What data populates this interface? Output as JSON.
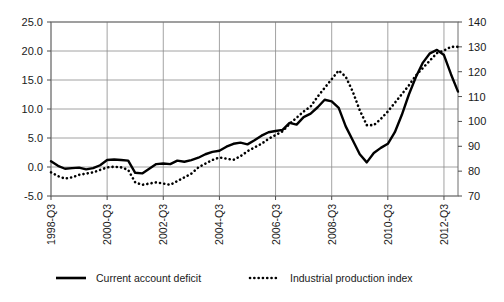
{
  "chart_data": {
    "type": "line",
    "title": "",
    "xlabel": "",
    "ylabel": "",
    "grid": true,
    "legend_position": "bottom",
    "x_tick_labels": [
      "1998-Q3",
      "2000-Q3",
      "2002-Q3",
      "2004-Q3",
      "2006-Q3",
      "2008-Q3",
      "2010-Q3",
      "2012-Q3"
    ],
    "x_tick_rotation": 90,
    "left_axis": {
      "label": "",
      "ylim": [
        -5.0,
        25.0
      ],
      "ticks": [
        "25.0",
        "20.0",
        "15.0",
        "10.0",
        "5.0",
        "0.0",
        "-5.0"
      ],
      "tick_values": [
        25.0,
        20.0,
        15.0,
        10.0,
        5.0,
        0.0,
        -5.0
      ]
    },
    "right_axis": {
      "label": "",
      "ylim": [
        70,
        140
      ],
      "ticks": [
        "140",
        "130",
        "120",
        "110",
        "100",
        "90",
        "80",
        "70"
      ],
      "tick_values": [
        140,
        130,
        120,
        110,
        100,
        90,
        80,
        70
      ]
    },
    "x": [
      "1998-Q3",
      "1998-Q4",
      "1999-Q1",
      "1999-Q2",
      "1999-Q3",
      "1999-Q4",
      "2000-Q1",
      "2000-Q2",
      "2000-Q3",
      "2000-Q4",
      "2001-Q1",
      "2001-Q2",
      "2001-Q3",
      "2001-Q4",
      "2002-Q1",
      "2002-Q2",
      "2002-Q3",
      "2002-Q4",
      "2003-Q1",
      "2003-Q2",
      "2003-Q3",
      "2003-Q4",
      "2004-Q1",
      "2004-Q2",
      "2004-Q3",
      "2004-Q4",
      "2005-Q1",
      "2005-Q2",
      "2005-Q3",
      "2005-Q4",
      "2006-Q1",
      "2006-Q2",
      "2006-Q3",
      "2006-Q4",
      "2007-Q1",
      "2007-Q2",
      "2007-Q3",
      "2007-Q4",
      "2008-Q1",
      "2008-Q2",
      "2008-Q3",
      "2008-Q4",
      "2009-Q1",
      "2009-Q2",
      "2009-Q3",
      "2009-Q4",
      "2010-Q1",
      "2010-Q2",
      "2010-Q3",
      "2010-Q4",
      "2011-Q1",
      "2011-Q2",
      "2011-Q3",
      "2011-Q4",
      "2012-Q1",
      "2012-Q2",
      "2012-Q3",
      "2012-Q4",
      "2013-Q1"
    ],
    "series": [
      {
        "name": "Current account deficit",
        "axis": "left",
        "style": "solid",
        "values": [
          1.0,
          0.2,
          -0.3,
          -0.2,
          -0.1,
          -0.4,
          -0.2,
          0.3,
          1.2,
          1.3,
          1.2,
          1.1,
          -1.0,
          -1.1,
          -0.3,
          0.5,
          0.6,
          0.5,
          1.1,
          0.9,
          1.2,
          1.6,
          2.2,
          2.6,
          2.8,
          3.5,
          4.0,
          4.2,
          3.9,
          4.6,
          5.4,
          6.0,
          6.2,
          6.4,
          7.6,
          7.3,
          8.6,
          9.2,
          10.3,
          11.6,
          11.3,
          10.2,
          7.0,
          4.6,
          2.2,
          0.8,
          2.4,
          3.3,
          4.0,
          6.0,
          9.0,
          12.5,
          15.5,
          18.0,
          19.6,
          20.2,
          19.3,
          16.0,
          13.0
        ]
      },
      {
        "name": "Industrial production index",
        "axis": "right",
        "style": "dotted",
        "values": [
          79.5,
          78.0,
          77.0,
          77.5,
          78.5,
          79.0,
          79.5,
          80.5,
          81.5,
          81.8,
          81.5,
          80.5,
          75.5,
          74.5,
          75.0,
          75.5,
          75.0,
          74.5,
          76.0,
          77.5,
          79.0,
          81.5,
          83.0,
          84.5,
          85.5,
          85.0,
          84.5,
          86.0,
          88.0,
          89.5,
          91.0,
          93.0,
          94.5,
          96.0,
          99.0,
          101.5,
          104.0,
          106.0,
          110.0,
          113.5,
          117.0,
          120.5,
          118.0,
          112.0,
          104.5,
          98.5,
          98.5,
          101.0,
          104.0,
          107.5,
          111.0,
          114.5,
          118.5,
          121.5,
          124.5,
          127.5,
          128.5,
          130.0,
          130.0
        ]
      }
    ]
  },
  "legend": {
    "entries": [
      {
        "label": "Current account deficit",
        "style": "solid"
      },
      {
        "label": "Industrial production index",
        "style": "dotted"
      }
    ]
  }
}
